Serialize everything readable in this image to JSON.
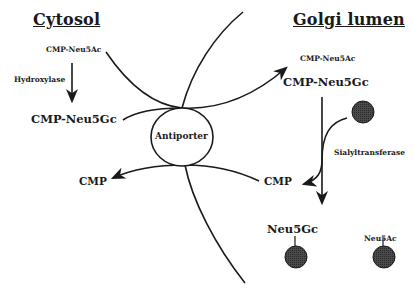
{
  "diagram": {
    "regions": {
      "left": "Cytosol",
      "right": "Golgi lumen"
    },
    "cytosol": {
      "substrate": "CMP-Neu5Ac",
      "enzyme": "Hydroxylase",
      "product": "CMP-Neu5Gc",
      "returned": "CMP"
    },
    "transporter": "Antiporter",
    "golgi": {
      "imported_minor": "CMP-Neu5Ac",
      "imported_major": "CMP-Neu5Gc",
      "enzyme": "Sialyltransferase",
      "released": "CMP",
      "glycan_gc": "Neu5Gc",
      "glycan_ac": "Neu5Ac"
    },
    "colors": {
      "line": "#1a1a1a",
      "acceptor_fill": "#3a3a3a",
      "antiporter_fill": "#ffffff"
    }
  }
}
